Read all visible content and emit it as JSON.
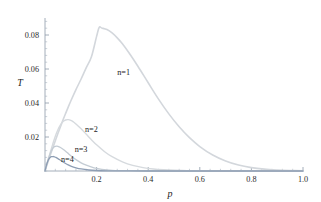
{
  "chart_data": {
    "type": "line",
    "title": "",
    "xlabel": "p",
    "ylabel": "T",
    "xlim": [
      0,
      1.0
    ],
    "ylim": [
      0,
      0.09
    ],
    "grid": false,
    "legend_position": "inline-annotations",
    "x_ticks": [
      "0.2",
      "0.4",
      "0.6",
      "0.8",
      "1.0"
    ],
    "x_tick_values": [
      0.2,
      0.4,
      0.6,
      0.8,
      1.0
    ],
    "y_ticks": [
      "0.02",
      "0.04",
      "0.06",
      "0.08"
    ],
    "y_tick_values": [
      0.02,
      0.04,
      0.06,
      0.08
    ],
    "x_minor_count": 4,
    "y_minor_count": 4,
    "series": [
      {
        "name": "n=1",
        "label": "n=1",
        "color": "#d3d7dc",
        "width": 1.6,
        "peak_x": 0.21,
        "peak_y": 0.0845,
        "label_x": 0.28,
        "label_y": 0.0565,
        "x": [
          0.0,
          0.01,
          0.02,
          0.03,
          0.04,
          0.05,
          0.06,
          0.07,
          0.08,
          0.09,
          0.1,
          0.12,
          0.14,
          0.16,
          0.18,
          0.2,
          0.21,
          0.22,
          0.24,
          0.26,
          0.28,
          0.3,
          0.33,
          0.36,
          0.4,
          0.44,
          0.48,
          0.52,
          0.56,
          0.6,
          0.65,
          0.7,
          0.75,
          0.8,
          0.85,
          0.9,
          0.95,
          1.0
        ],
        "y": [
          0.0,
          0.0046,
          0.0091,
          0.0135,
          0.0178,
          0.022,
          0.0261,
          0.0301,
          0.0339,
          0.0376,
          0.0412,
          0.0479,
          0.0541,
          0.0608,
          0.0672,
          0.0792,
          0.0845,
          0.0841,
          0.0832,
          0.0812,
          0.0783,
          0.0748,
          0.0685,
          0.0616,
          0.0519,
          0.0423,
          0.0336,
          0.026,
          0.0196,
          0.0144,
          0.0094,
          0.0059,
          0.0035,
          0.002,
          0.0011,
          0.0006,
          0.0003,
          0.0001
        ]
      },
      {
        "name": "n=2",
        "label": "n=2",
        "color": "#d6dade",
        "width": 1.4,
        "peak_x": 0.09,
        "peak_y": 0.0302,
        "label_x": 0.155,
        "label_y": 0.0228,
        "x": [
          0.0,
          0.01,
          0.02,
          0.03,
          0.04,
          0.05,
          0.06,
          0.07,
          0.08,
          0.09,
          0.1,
          0.11,
          0.12,
          0.14,
          0.16,
          0.18,
          0.2,
          0.23,
          0.26,
          0.3,
          0.34,
          0.38,
          0.42,
          0.46,
          0.5,
          0.55,
          0.6,
          0.65,
          0.7,
          0.75,
          0.8,
          0.85,
          0.9,
          0.95,
          1.0
        ],
        "y": [
          0.0,
          0.0055,
          0.0108,
          0.0158,
          0.0205,
          0.0243,
          0.0272,
          0.0291,
          0.03,
          0.0302,
          0.0298,
          0.0289,
          0.0277,
          0.0248,
          0.0216,
          0.0184,
          0.0154,
          0.0115,
          0.0084,
          0.0054,
          0.0033,
          0.002,
          0.0012,
          0.0007,
          0.0004,
          0.0002,
          0.0001,
          5e-05,
          2e-05,
          1e-05,
          0.0,
          0.0,
          0.0,
          0.0,
          0.0
        ]
      },
      {
        "name": "n=3",
        "label": "n=3",
        "color": "#c4ccd4",
        "width": 1.3,
        "peak_x": 0.05,
        "peak_y": 0.0145,
        "label_x": 0.115,
        "label_y": 0.0113,
        "x": [
          0.0,
          0.005,
          0.01,
          0.015,
          0.02,
          0.025,
          0.03,
          0.035,
          0.04,
          0.045,
          0.05,
          0.06,
          0.07,
          0.08,
          0.09,
          0.1,
          0.12,
          0.14,
          0.16,
          0.19,
          0.22,
          0.26,
          0.3,
          0.35,
          0.4,
          0.45,
          0.5,
          0.6,
          0.7,
          0.8,
          0.9,
          1.0
        ],
        "y": [
          0.0,
          0.0029,
          0.0057,
          0.0081,
          0.0102,
          0.012,
          0.0133,
          0.0141,
          0.0145,
          0.0146,
          0.0145,
          0.0138,
          0.0128,
          0.0116,
          0.0103,
          0.009,
          0.0067,
          0.0048,
          0.0034,
          0.0019,
          0.001,
          0.0004,
          0.0002,
          7e-05,
          2e-05,
          1e-05,
          0.0,
          0.0,
          0.0,
          0.0,
          0.0,
          0.0
        ]
      },
      {
        "name": "n=4",
        "label": "n=4",
        "color": "#8e9eb4",
        "width": 1.3,
        "peak_x": 0.033,
        "peak_y": 0.0085,
        "label_x": 0.062,
        "label_y": 0.0055,
        "x": [
          0.0,
          0.004,
          0.008,
          0.012,
          0.016,
          0.02,
          0.025,
          0.03,
          0.033,
          0.037,
          0.042,
          0.05,
          0.06,
          0.07,
          0.08,
          0.09,
          0.1,
          0.12,
          0.14,
          0.17,
          0.2,
          0.24,
          0.28,
          0.33,
          0.4,
          0.5,
          0.6,
          0.7,
          0.8,
          0.9,
          1.0
        ],
        "y": [
          0.0,
          0.0025,
          0.0046,
          0.0062,
          0.0073,
          0.008,
          0.0084,
          0.0085,
          0.0085,
          0.0083,
          0.008,
          0.0073,
          0.0063,
          0.0053,
          0.0044,
          0.0036,
          0.0029,
          0.0019,
          0.0012,
          0.0006,
          0.0003,
          0.00012,
          5e-05,
          2e-05,
          0.0,
          0.0,
          0.0,
          0.0,
          0.0,
          0.0,
          0.0
        ]
      }
    ]
  },
  "figure": {
    "background": "#ffffff",
    "axis_color": "#8d9aa8"
  }
}
